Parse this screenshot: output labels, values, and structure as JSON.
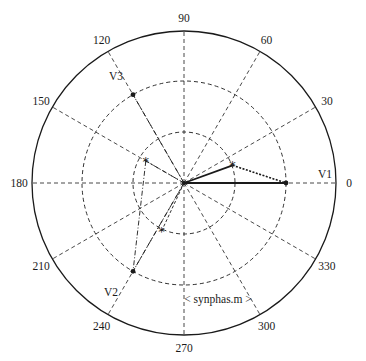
{
  "title": "< synphas.m >",
  "polar": {
    "center": [
      184,
      183
    ],
    "outer_radius": 152,
    "rings": [
      51,
      102
    ],
    "angle_labels": [
      "0",
      "30",
      "60",
      "90",
      "120",
      "150",
      "180",
      "210",
      "240",
      "270",
      "300",
      "330"
    ],
    "angles": [
      0,
      30,
      60,
      90,
      120,
      150,
      180,
      210,
      240,
      270,
      300,
      330
    ]
  },
  "phasors": [
    {
      "name": "V1",
      "label": "V1",
      "angle_deg": 0,
      "magnitude_ring": 2
    },
    {
      "name": "V2",
      "label": "V2",
      "angle_deg": 240,
      "magnitude_ring": 2
    },
    {
      "name": "V3",
      "label": "V3",
      "angle_deg": 120,
      "magnitude_ring": 2
    }
  ],
  "symmetric_components": [
    {
      "name": "star-right",
      "approx_angle_deg": 20,
      "approx_radius_fraction": 0.34
    },
    {
      "name": "star-upper-left",
      "approx_angle_deg": 150,
      "approx_radius_fraction": 0.29
    },
    {
      "name": "star-lower",
      "approx_angle_deg": 245,
      "approx_radius_fraction": 0.35
    }
  ],
  "colors": {
    "line": "#1a1a1a",
    "background": "#ffffff"
  }
}
